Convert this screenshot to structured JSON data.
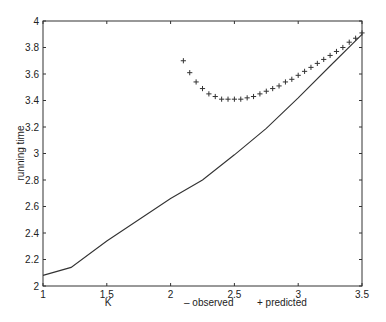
{
  "chart_data": {
    "type": "line",
    "title": "",
    "xlabel": "K",
    "ylabel": "running time",
    "xlim": [
      1,
      3.5
    ],
    "ylim": [
      2,
      4
    ],
    "grid": false,
    "xticks": [
      1,
      1.5,
      2,
      2.5,
      3,
      3.5
    ],
    "xtick_labels": [
      "1",
      "1.5",
      "2",
      "2.5",
      "3",
      "3.5"
    ],
    "yticks": [
      2,
      2.2,
      2.4,
      2.6,
      2.8,
      3,
      3.2,
      3.4,
      3.6,
      3.8,
      4
    ],
    "ytick_labels": [
      "2",
      "2.2",
      "2.4",
      "2.6",
      "2.8",
      "3",
      "3.2",
      "3.4",
      "3.6",
      "3.8",
      "4"
    ],
    "legend_position": "bottom, beside x-axis label",
    "series": [
      {
        "name": "observed",
        "style": "solid line",
        "legend_label": "– observed",
        "x": [
          1.0,
          1.22,
          1.5,
          2.0,
          2.25,
          2.5,
          2.75,
          3.0,
          3.25,
          3.5
        ],
        "y": [
          2.08,
          2.14,
          2.34,
          2.66,
          2.8,
          2.99,
          3.19,
          3.42,
          3.66,
          3.9
        ]
      },
      {
        "name": "predicted",
        "style": "+ markers",
        "legend_label": "+ predicted",
        "x": [
          2.1,
          2.15,
          2.2,
          2.25,
          2.3,
          2.35,
          2.4,
          2.45,
          2.5,
          2.55,
          2.6,
          2.65,
          2.7,
          2.75,
          2.8,
          2.85,
          2.9,
          2.95,
          3.0,
          3.05,
          3.1,
          3.15,
          3.2,
          3.25,
          3.3,
          3.35,
          3.4,
          3.45,
          3.5
        ],
        "y": [
          3.7,
          3.61,
          3.54,
          3.49,
          3.45,
          3.43,
          3.41,
          3.41,
          3.41,
          3.41,
          3.42,
          3.43,
          3.45,
          3.47,
          3.49,
          3.51,
          3.54,
          3.56,
          3.59,
          3.62,
          3.65,
          3.68,
          3.71,
          3.74,
          3.77,
          3.8,
          3.84,
          3.87,
          3.91
        ]
      }
    ]
  },
  "legend": {
    "observed": "– observed",
    "predicted": "+ predicted"
  },
  "colors": {
    "line": "#333333",
    "axis": "#333333",
    "background": "#ffffff"
  }
}
